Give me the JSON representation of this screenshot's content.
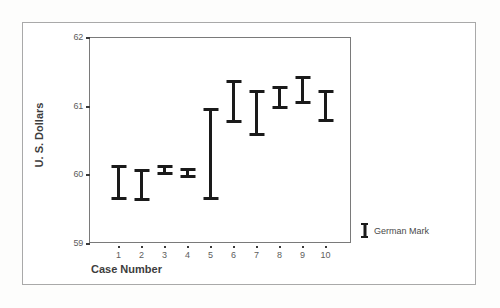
{
  "chart_data": {
    "type": "bar",
    "subtype": "error-bar-range",
    "title": "",
    "xlabel": "Case Number",
    "ylabel": "U. S. Dollars",
    "categories": [
      "1",
      "2",
      "3",
      "4",
      "5",
      "6",
      "7",
      "8",
      "9",
      "10"
    ],
    "xtick_labels": [
      "1",
      "2",
      "3",
      "4",
      "5",
      "6",
      "7",
      "8",
      "9",
      "10"
    ],
    "ytick_labels": [
      "59",
      "60",
      "61",
      "62"
    ],
    "ytick_values": [
      59,
      60,
      61,
      62
    ],
    "ylim": [
      59,
      62
    ],
    "grid": false,
    "legend": {
      "position": "right",
      "entries": [
        {
          "label": "German Mark",
          "symbol": "error-bar-icon",
          "color": "#1a1a1a"
        }
      ]
    },
    "series": [
      {
        "name": "German Mark",
        "color": "#1a1a1a",
        "lower": [
          59.62,
          59.61,
          59.99,
          59.94,
          59.62,
          60.75,
          60.56,
          60.95,
          61.02,
          60.76
        ],
        "upper": [
          60.14,
          60.08,
          60.13,
          60.09,
          60.97,
          61.37,
          61.23,
          61.29,
          61.43,
          61.23
        ]
      }
    ],
    "points": [
      {
        "case": "1",
        "lower": 59.62,
        "upper": 60.14
      },
      {
        "case": "2",
        "lower": 59.61,
        "upper": 60.08
      },
      {
        "case": "3",
        "lower": 59.99,
        "upper": 60.13
      },
      {
        "case": "4",
        "lower": 59.94,
        "upper": 60.09
      },
      {
        "case": "5",
        "lower": 59.62,
        "upper": 60.97
      },
      {
        "case": "6",
        "lower": 60.75,
        "upper": 61.37
      },
      {
        "case": "7",
        "lower": 60.56,
        "upper": 61.23
      },
      {
        "case": "8",
        "lower": 60.95,
        "upper": 61.29
      },
      {
        "case": "9",
        "lower": 61.02,
        "upper": 61.43
      },
      {
        "case": "10",
        "lower": 60.76,
        "upper": 61.23
      }
    ]
  }
}
